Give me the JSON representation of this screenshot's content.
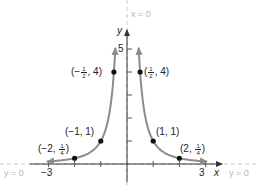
{
  "chart_data": {
    "type": "line",
    "title": "",
    "function": "y = 1/x^2",
    "xlabel": "x",
    "ylabel": "y",
    "xlim": [
      -3.2,
      3.6
    ],
    "ylim": [
      0,
      5.6
    ],
    "x_ticks": [
      -3,
      -2,
      -1,
      1,
      2,
      3
    ],
    "x_tick_labels": [
      "-3",
      "3"
    ],
    "y_ticks": [
      1,
      2,
      3,
      4,
      5
    ],
    "y_tick_labels": [
      "5"
    ],
    "grid": false,
    "series": [
      {
        "name": "left branch",
        "x": [
          -3,
          -2,
          -1,
          -0.5,
          -0.45
        ],
        "y": [
          0.111,
          0.25,
          1,
          4,
          4.94
        ]
      },
      {
        "name": "right branch",
        "x": [
          0.45,
          0.5,
          1,
          2,
          3
        ],
        "y": [
          4.94,
          4,
          1,
          0.25,
          0.111
        ]
      }
    ],
    "points": [
      {
        "x": -2,
        "y": 0.25,
        "label": "(−2, 1/4)"
      },
      {
        "x": -1,
        "y": 1,
        "label": "(−1, 1)"
      },
      {
        "x": -0.5,
        "y": 4,
        "label": "(−1/2, 4)"
      },
      {
        "x": 0.5,
        "y": 4,
        "label": "(1/2, 4)"
      },
      {
        "x": 1,
        "y": 1,
        "label": "(1, 1)"
      },
      {
        "x": 2,
        "y": 0.25,
        "label": "(2, 1/4)"
      }
    ],
    "asymptotes": [
      {
        "type": "vertical",
        "label": "x = 0"
      },
      {
        "type": "horizontal",
        "label": "y = 0"
      }
    ],
    "colors": {
      "curve": "#8c8c8c",
      "asymptote": "#c4c4c4",
      "axis": "#333333",
      "point": "#111111"
    }
  },
  "labels": {
    "x_axis": "x",
    "y_axis": "y",
    "tick_neg3": "−3",
    "tick_3": "3",
    "tick_5": "5",
    "asym_vertical": "x = 0",
    "asym_horizontal_left": "y = 0",
    "asym_horizontal_right": "y = 0",
    "pt_neg_half": {
      "pre": "(−",
      "num": "1",
      "den": "2",
      "post": ", 4)"
    },
    "pt_pos_half": {
      "pre": "(",
      "num": "1",
      "den": "2",
      "post": ", 4)"
    },
    "pt_neg1": "(−1,  1)",
    "pt_pos1": "(1,  1)",
    "pt_neg2": {
      "pre": "(−2, ",
      "num": "1",
      "den": "4",
      "post": ")"
    },
    "pt_pos2": {
      "pre": "(2, ",
      "num": "1",
      "den": "4",
      "post": ")"
    }
  }
}
